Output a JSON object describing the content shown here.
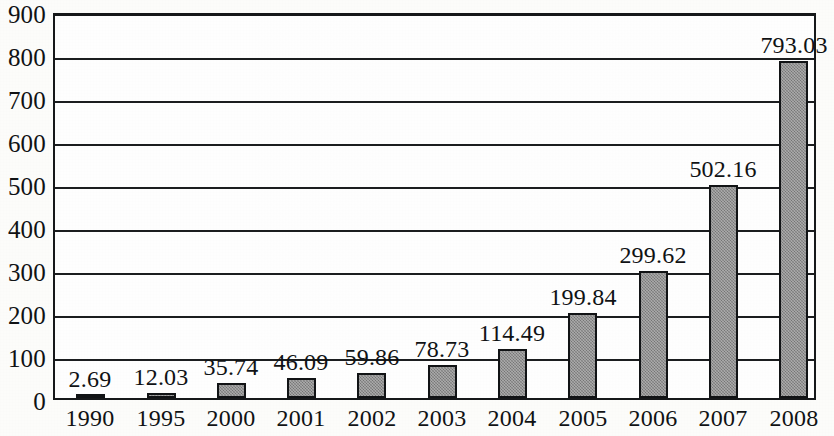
{
  "chart_data": {
    "type": "bar",
    "title": "",
    "subtitle": "",
    "xlabel": "",
    "ylabel": "",
    "categories": [
      "1990",
      "1995",
      "2000",
      "2001",
      "2002",
      "2003",
      "2004",
      "2005",
      "2006",
      "2007",
      "2008"
    ],
    "values": [
      2.69,
      12.03,
      35.74,
      46.09,
      59.86,
      78.73,
      114.49,
      199.84,
      299.62,
      502.16,
      793.03
    ],
    "data_labels": [
      "2.69",
      "12.03",
      "35.74",
      "46.09",
      "59.86",
      "78.73",
      "114.49",
      "199.84",
      "299.62",
      "502.16",
      "793.03"
    ],
    "ylim": [
      0,
      900
    ],
    "ytick_step": 100,
    "ytick_labels": [
      "900",
      "800",
      "700",
      "600",
      "500",
      "400",
      "300",
      "200",
      "100",
      "0"
    ],
    "ytick_values": [
      900,
      800,
      700,
      600,
      500,
      400,
      300,
      200,
      100,
      0
    ],
    "grid": true,
    "grid_axis": "y",
    "legend": false,
    "legend_position": "none",
    "series": [
      {
        "name": "",
        "values": [
          2.69,
          12.03,
          35.74,
          46.09,
          59.86,
          78.73,
          114.49,
          199.84,
          299.62,
          502.16,
          793.03
        ],
        "bar_fill_color": "#8b8b8b",
        "bar_border_color": "#111315"
      }
    ],
    "colors": {
      "bar_fill": "#8b8b8b",
      "bar_border": "#111315",
      "gridline": "#1b1d1f",
      "axis": "#16181a",
      "text": "#101214",
      "plot_background": "#ffffff",
      "figure_background": "#fdfdfb"
    }
  }
}
